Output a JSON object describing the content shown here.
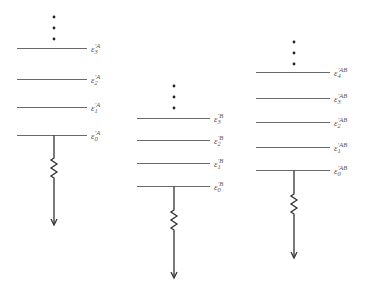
{
  "diagram": {
    "type": "energy-level-diagram",
    "columns": [
      {
        "id": "A",
        "symbol": "ε",
        "superscript": "′A",
        "levels": [
          {
            "subscript": "0",
            "label": "ε′0A"
          },
          {
            "subscript": "1",
            "label": "ε′1A"
          },
          {
            "subscript": "2",
            "label": "ε′2A"
          },
          {
            "subscript": "3",
            "label": "ε′3A"
          }
        ],
        "continuation": "⋮",
        "decay": "zigzag-arrow-down"
      },
      {
        "id": "B",
        "symbol": "ε",
        "superscript": "′B",
        "levels": [
          {
            "subscript": "0",
            "label": "ε′0B"
          },
          {
            "subscript": "1",
            "label": "ε′1B"
          },
          {
            "subscript": "2",
            "label": "ε′2B"
          },
          {
            "subscript": "3",
            "label": "ε′3B"
          }
        ],
        "continuation": "⋮",
        "decay": "zigzag-arrow-down"
      },
      {
        "id": "AB",
        "symbol": "ε",
        "superscript": "′AB",
        "levels": [
          {
            "subscript": "0",
            "label": "ε′0AB"
          },
          {
            "subscript": "1",
            "label": "ε′1AB"
          },
          {
            "subscript": "2",
            "label": "ε′2AB"
          },
          {
            "subscript": "3",
            "label": "ε′3AB"
          },
          {
            "subscript": "4",
            "label": "ε′4AB"
          }
        ],
        "continuation": "⋮",
        "decay": "zigzag-arrow-down"
      }
    ]
  },
  "labels": {
    "a": {
      "sym": "ε",
      "sup": "′A",
      "l0": "0",
      "l1": "1",
      "l2": "2",
      "l3": "3"
    },
    "b": {
      "sym": "ε",
      "sup": "′B",
      "l0": "0",
      "l1": "1",
      "l2": "2",
      "l3": "3"
    },
    "ab": {
      "sym": "ε",
      "sup": "′AB",
      "l0": "0",
      "l1": "1",
      "l2": "2",
      "l3": "3",
      "l4": "4"
    }
  },
  "colors": {
    "level_line": "#6a6a6a",
    "stem": "#333333",
    "dots": "#222222",
    "label_text": "#555555"
  }
}
